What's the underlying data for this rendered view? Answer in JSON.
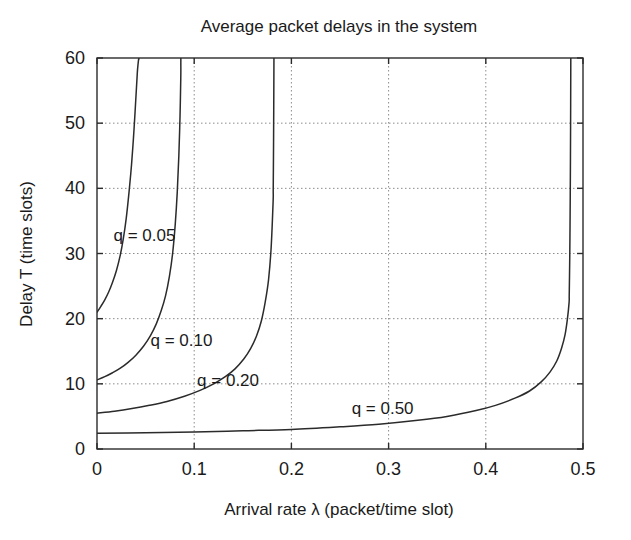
{
  "chart_data": {
    "type": "line",
    "title": "Average packet delays in the system",
    "xlabel": "Arrival rate λ (packet/time slot)",
    "ylabel": "Delay T (time slots)",
    "xlim": [
      0,
      0.5
    ],
    "ylim": [
      0,
      60
    ],
    "xticks": [
      0,
      0.1,
      0.2,
      0.3,
      0.4,
      0.5
    ],
    "xtick_labels": [
      "0",
      "0.1",
      "0.2",
      "0.3",
      "0.4",
      "0.5"
    ],
    "yticks": [
      0,
      10,
      20,
      30,
      40,
      50,
      60
    ],
    "ytick_labels": [
      "0",
      "10",
      "20",
      "30",
      "40",
      "50",
      "60"
    ],
    "grid": true,
    "legend_position": "inline-annotations",
    "series": [
      {
        "name": "q = 0.05",
        "label": "q = 0.05",
        "q": 0.05,
        "asymptote_lambda": 0.0435,
        "x": [
          0.0,
          0.004,
          0.008,
          0.012,
          0.016,
          0.02,
          0.024,
          0.027,
          0.03,
          0.033,
          0.0355,
          0.0375,
          0.0392,
          0.0405,
          0.0415,
          0.0422,
          0.0428,
          0.0431
        ],
        "y": [
          21.0,
          21.9,
          22.9,
          24.1,
          25.6,
          27.4,
          29.8,
          32.2,
          35.3,
          39.5,
          43.6,
          47.7,
          51.8,
          55.2,
          57.8,
          59.0,
          59.8,
          60.0
        ]
      },
      {
        "name": "q = 0.10",
        "label": "q = 0.10",
        "q": 0.1,
        "asymptote_lambda": 0.0875,
        "x": [
          0.0,
          0.008,
          0.016,
          0.024,
          0.032,
          0.04,
          0.048,
          0.055,
          0.061,
          0.066,
          0.0705,
          0.0745,
          0.0778,
          0.0805,
          0.0826,
          0.0842,
          0.0854,
          0.0862
        ],
        "y": [
          10.6,
          11.1,
          11.7,
          12.4,
          13.3,
          14.4,
          15.8,
          17.4,
          19.2,
          21.2,
          23.5,
          26.5,
          30.0,
          34.5,
          39.5,
          45.0,
          51.0,
          57.0
        ]
      },
      {
        "name": "q = 0.20",
        "label": "q = 0.20",
        "q": 0.2,
        "asymptote_lambda": 0.1835,
        "x": [
          0.0,
          0.018,
          0.036,
          0.054,
          0.072,
          0.09,
          0.106,
          0.12,
          0.132,
          0.142,
          0.151,
          0.158,
          0.164,
          0.169,
          0.173,
          0.1765,
          0.1792,
          0.1812
        ],
        "y": [
          5.5,
          5.8,
          6.2,
          6.7,
          7.3,
          8.1,
          9.0,
          10.0,
          11.1,
          12.3,
          13.8,
          15.4,
          17.3,
          19.6,
          22.5,
          26.0,
          31.0,
          38.0
        ]
      },
      {
        "name": "q = 0.50",
        "label": "q = 0.50",
        "q": 0.5,
        "asymptote_lambda": 0.4885,
        "x": [
          0.0,
          0.05,
          0.1,
          0.15,
          0.2,
          0.25,
          0.29,
          0.33,
          0.36,
          0.39,
          0.41,
          0.43,
          0.445,
          0.457,
          0.466,
          0.473,
          0.478,
          0.4815,
          0.484,
          0.4857
        ],
        "y": [
          2.4,
          2.5,
          2.6,
          2.8,
          3.0,
          3.4,
          3.8,
          4.4,
          5.0,
          5.9,
          6.7,
          7.8,
          8.9,
          10.3,
          11.8,
          13.5,
          15.5,
          17.5,
          20.0,
          22.5
        ]
      }
    ],
    "annotations": [
      {
        "text": "q = 0.05",
        "x": 0.017,
        "y": 32.8
      },
      {
        "text": "q = 0.10",
        "x": 0.055,
        "y": 16.7
      },
      {
        "text": "q = 0.20",
        "x": 0.103,
        "y": 10.6
      },
      {
        "text": "q = 0.50",
        "x": 0.262,
        "y": 6.3
      }
    ]
  },
  "colors": {
    "curve": "#2b2b2b",
    "frame": "#2b2b2b",
    "grid": "#8c8c8c",
    "text": "#1a1a1a",
    "background": "#ffffff"
  }
}
